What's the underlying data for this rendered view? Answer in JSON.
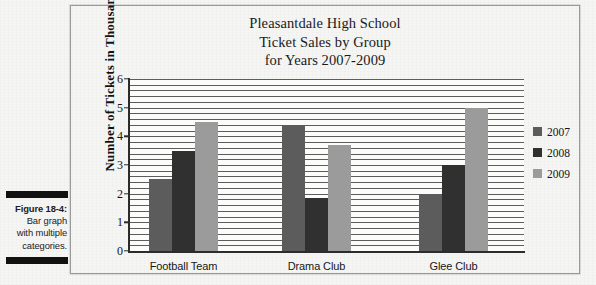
{
  "figure_caption": {
    "label": "Figure 18-4:",
    "lines": [
      "Bar graph",
      "with multiple",
      "categories."
    ]
  },
  "chart_data": {
    "type": "bar",
    "title": "Pleasantdale High School Ticket Sales by Group for Years 2007-2009",
    "title_lines": [
      "Pleasantdale High School",
      "Ticket Sales by Group",
      "for Years 2007-2009"
    ],
    "categories": [
      "Football Team",
      "Drama Club",
      "Glee Club"
    ],
    "series": [
      {
        "name": "2007",
        "color": "#5c5c5c",
        "values": [
          2.5,
          4.4,
          2.0
        ]
      },
      {
        "name": "2008",
        "color": "#303030",
        "values": [
          3.5,
          1.85,
          3.0
        ]
      },
      {
        "name": "2009",
        "color": "#9b9b9b",
        "values": [
          4.5,
          3.7,
          5.0
        ]
      }
    ],
    "xlabel": "",
    "ylabel": "Number of Tickets in Thousands",
    "ylim": [
      0,
      6
    ],
    "yticks": [
      0,
      1,
      2,
      3,
      4,
      5,
      6
    ],
    "ytick_labels": [
      "0",
      "1",
      "2",
      "3",
      "4",
      "5",
      "6"
    ],
    "grid": "horizontal-dense",
    "legend_position": "right",
    "legend_entries": [
      "2007",
      "2008",
      "2009"
    ]
  }
}
